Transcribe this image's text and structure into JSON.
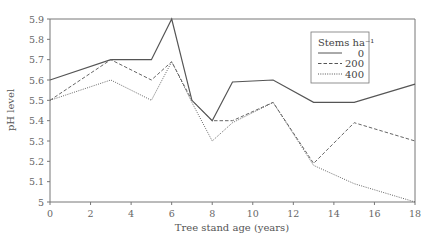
{
  "chart_data": {
    "type": "line",
    "title": "",
    "xlabel": "Tree stand age (years)",
    "ylabel": "pH level",
    "xlim": [
      0,
      18
    ],
    "ylim": [
      5,
      5.9
    ],
    "xticks": [
      0,
      2,
      4,
      6,
      8,
      10,
      12,
      14,
      16,
      18
    ],
    "yticks": [
      5,
      5.1,
      5.2,
      5.3,
      5.4,
      5.5,
      5.6,
      5.7,
      5.8,
      5.9
    ],
    "ytick_labels": [
      "5",
      "5.1",
      "5.2",
      "5.3",
      "5.4",
      "5.5",
      "5.6",
      "5.7",
      "5.8",
      "5.9"
    ],
    "grid": false,
    "legend": {
      "title": "Stems ha⁻¹",
      "position": "upper right"
    },
    "x": [
      0,
      3,
      5,
      6,
      7,
      8,
      9,
      11,
      13,
      15,
      18
    ],
    "series": [
      {
        "name": "0",
        "style": "solid",
        "values": [
          5.6,
          5.7,
          5.7,
          5.9,
          5.5,
          5.4,
          5.59,
          5.6,
          5.49,
          5.49,
          5.58
        ]
      },
      {
        "name": "200",
        "style": "dashed",
        "values": [
          5.5,
          5.7,
          5.6,
          5.69,
          5.5,
          5.4,
          5.4,
          5.49,
          5.19,
          5.39,
          5.3
        ]
      },
      {
        "name": "400",
        "style": "dotted",
        "values": [
          5.5,
          5.6,
          5.5,
          5.69,
          5.49,
          5.3,
          5.39,
          5.49,
          5.18,
          5.09,
          5.0
        ]
      }
    ]
  }
}
